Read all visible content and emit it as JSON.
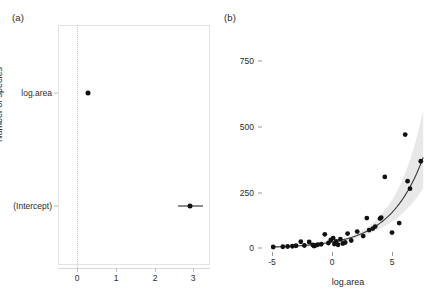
{
  "figure": {
    "panel_a_letter": "(a)",
    "panel_b_letter": "(b)"
  },
  "chart_data": [
    {
      "type": "scatter",
      "panel": "(a)",
      "subtype": "coefficient-plot",
      "title": "",
      "xlabel": "",
      "ylabel": "",
      "xlim": [
        -0.35,
        3.6
      ],
      "ylim": [
        0,
        1
      ],
      "grid": false,
      "legend": null,
      "reference_line": {
        "x": 0,
        "style": "dotted"
      },
      "xticks": [
        0,
        1,
        2,
        3
      ],
      "xticklabels": [
        "0",
        "1",
        "2",
        "3"
      ],
      "yticklabels": [
        "log.area",
        "(Intercept)"
      ],
      "terms": [
        {
          "label": "log.area",
          "estimate": 0.36,
          "conf_low": 0.33,
          "conf_high": 0.39
        },
        {
          "label": "(Intercept)",
          "estimate": 3.16,
          "conf_low": 2.92,
          "conf_high": 3.42
        }
      ]
    },
    {
      "type": "scatter",
      "panel": "(b)",
      "subtype": "scatter-with-fit",
      "title": "",
      "xlabel": "log.area",
      "ylabel": "Number of species",
      "xlim": [
        -5.8,
        8.6
      ],
      "ylim": [
        -30,
        880
      ],
      "grid": false,
      "legend": null,
      "xticks": [
        -5,
        0,
        5
      ],
      "xticklabels": [
        "-5",
        "0",
        "5"
      ],
      "yticks": [
        0,
        250,
        500,
        750
      ],
      "yticklabels": [
        "0",
        "250",
        "500",
        "750"
      ],
      "points": [
        {
          "x": -4.9,
          "y": 4
        },
        {
          "x": -4.1,
          "y": 5
        },
        {
          "x": -3.7,
          "y": 6
        },
        {
          "x": -3.3,
          "y": 7
        },
        {
          "x": -3.0,
          "y": 9
        },
        {
          "x": -2.6,
          "y": 25
        },
        {
          "x": -2.3,
          "y": 10
        },
        {
          "x": -1.9,
          "y": 24
        },
        {
          "x": -1.6,
          "y": 12
        },
        {
          "x": -1.5,
          "y": 8
        },
        {
          "x": -1.4,
          "y": 10
        },
        {
          "x": -1.2,
          "y": 13
        },
        {
          "x": -0.9,
          "y": 15
        },
        {
          "x": -0.6,
          "y": 55
        },
        {
          "x": -0.3,
          "y": 20
        },
        {
          "x": -0.1,
          "y": 32
        },
        {
          "x": 0.1,
          "y": 40
        },
        {
          "x": 0.2,
          "y": 16
        },
        {
          "x": 0.35,
          "y": 26
        },
        {
          "x": 0.5,
          "y": 13
        },
        {
          "x": 0.7,
          "y": 35
        },
        {
          "x": 0.9,
          "y": 18
        },
        {
          "x": 1.1,
          "y": 22
        },
        {
          "x": 1.3,
          "y": 58
        },
        {
          "x": 1.6,
          "y": 30
        },
        {
          "x": 2.1,
          "y": 66
        },
        {
          "x": 2.6,
          "y": 48
        },
        {
          "x": 2.9,
          "y": 120
        },
        {
          "x": 3.1,
          "y": 72
        },
        {
          "x": 3.4,
          "y": 78
        },
        {
          "x": 3.6,
          "y": 86
        },
        {
          "x": 4.0,
          "y": 118
        },
        {
          "x": 4.1,
          "y": 122
        },
        {
          "x": 4.4,
          "y": 285
        },
        {
          "x": 5.0,
          "y": 62
        },
        {
          "x": 5.6,
          "y": 100
        },
        {
          "x": 6.1,
          "y": 455
        },
        {
          "x": 6.3,
          "y": 268
        },
        {
          "x": 6.5,
          "y": 238
        },
        {
          "x": 7.4,
          "y": 348
        }
      ],
      "fit_curve": {
        "description": "exponential fit: y = exp(3.16 + 0.36x)",
        "intercept": 3.16,
        "slope": 0.36,
        "x_range": [
          -5.0,
          7.6
        ]
      },
      "confidence_band": {
        "level": 0.95,
        "color": "#e0e0e0",
        "description": "shaded band widening toward high log.area"
      }
    }
  ]
}
